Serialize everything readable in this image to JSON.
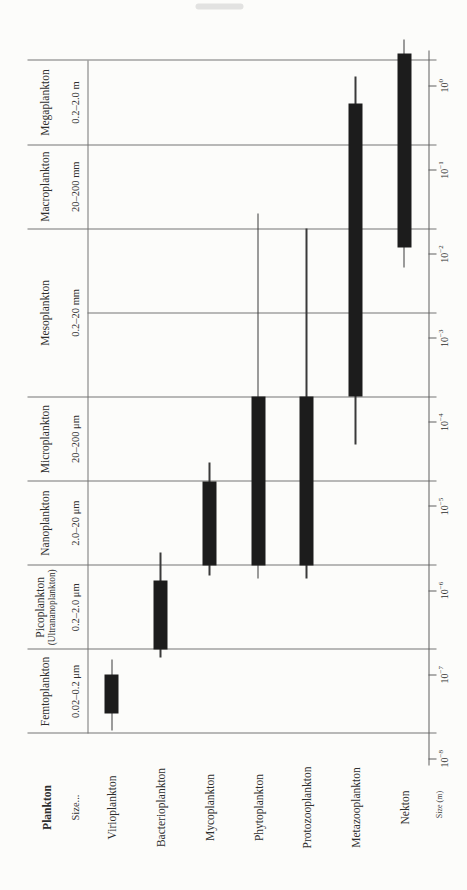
{
  "colors": {
    "bar": "#1c1c1c",
    "grid_line": "#757575",
    "text": "#2e2e2e",
    "background": "#fcfcfa"
  },
  "chart_data": {
    "type": "bar",
    "subtype": "log-range-bars-with-whiskers",
    "title": "",
    "orientation": "figure printed rotated 90° counterclockwise on page",
    "header": {
      "col1": "Plankton",
      "col2": "Size..."
    },
    "axis": {
      "label": "Size (m)",
      "scale": "log",
      "tick_base": "10",
      "tick_exponents": [
        -8,
        -7,
        -6,
        -5,
        -4,
        -3,
        -2,
        -1,
        0
      ],
      "domain_m": [
        2e-08,
        2.0
      ],
      "grid": "class boundaries at 2×10^n"
    },
    "inner_gridlines_m": [
      0.002
    ],
    "size_classes": [
      {
        "name": "Femtoplankton",
        "subname": "",
        "range_label": "0.02–0.2 μm",
        "from_m": 2e-08,
        "to_m": 2e-07
      },
      {
        "name": "Picoplankton",
        "subname": "(Ultrananoplankton)",
        "range_label": "0.2–2.0 μm",
        "from_m": 2e-07,
        "to_m": 2e-06
      },
      {
        "name": "Nanoplankton",
        "subname": "",
        "range_label": "2.0–20 μm",
        "from_m": 2e-06,
        "to_m": 2e-05
      },
      {
        "name": "Microplankton",
        "subname": "",
        "range_label": "20–200 μm",
        "from_m": 2e-05,
        "to_m": 0.0002
      },
      {
        "name": "Mesoplankton",
        "subname": "",
        "range_label": "0.2–20 mm",
        "from_m": 0.0002,
        "to_m": 0.02
      },
      {
        "name": "Macroplankton",
        "subname": "",
        "range_label": "20–200 mm",
        "from_m": 0.02,
        "to_m": 0.2
      },
      {
        "name": "Megaplankton",
        "subname": "",
        "range_label": "0.2–2.0 m",
        "from_m": 0.2,
        "to_m": 2.0
      }
    ],
    "organisms": [
      {
        "name": "Virioplankton",
        "bar_m": [
          3.5e-08,
          1e-07
        ],
        "whisker_m": [
          2.2e-08,
          1.5e-07
        ]
      },
      {
        "name": "Bacterioplankton",
        "bar_m": [
          2e-07,
          1.3e-06
        ],
        "whisker_m": [
          1.6e-07,
          2.8e-06
        ]
      },
      {
        "name": "Mycoplankton",
        "bar_m": [
          2e-06,
          2e-05
        ],
        "whisker_m": [
          1.5e-06,
          3.3e-05
        ]
      },
      {
        "name": "Phytoplankton",
        "bar_m": [
          2e-06,
          0.0002
        ],
        "whisker_m": [
          1.4e-06,
          0.03
        ]
      },
      {
        "name": "Protozooplankton",
        "bar_m": [
          2e-06,
          0.0002
        ],
        "whisker_m": [
          1.4e-06,
          0.02
        ]
      },
      {
        "name": "Metazooplankton",
        "bar_m": [
          0.0002,
          0.62
        ],
        "whisker_m": [
          5.5e-05,
          1.3
        ]
      },
      {
        "name": "Nekton",
        "bar_m": [
          0.012,
          2.4
        ],
        "whisker_m": [
          0.007,
          3.6
        ]
      }
    ]
  }
}
